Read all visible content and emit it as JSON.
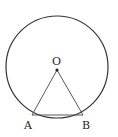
{
  "diagram": {
    "labels": {
      "center": "O",
      "point_a": "A",
      "point_b": "B"
    },
    "colors": {
      "stroke": "#333333",
      "background": "#ffffff"
    }
  }
}
